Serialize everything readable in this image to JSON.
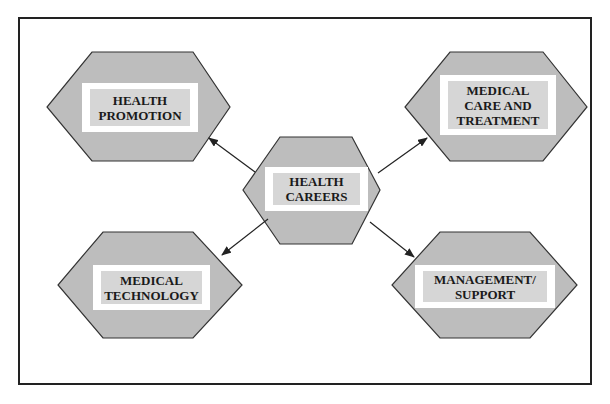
{
  "diagram": {
    "type": "hub-and-spoke",
    "colors": {
      "hexagon_fill": "#bdbdbd",
      "hexagon_stroke": "#333333",
      "label_outer": "#ffffff",
      "label_inner": "#d6d6d6",
      "arrow": "#222222",
      "frame": "#222222"
    },
    "center": {
      "id": "health-careers",
      "label": "HEALTH\nCAREERS"
    },
    "nodes": [
      {
        "id": "health-promotion",
        "label": "HEALTH\nPROMOTION",
        "position": "top-left"
      },
      {
        "id": "medical-care-and-treatment",
        "label": "MEDICAL\nCARE AND\nTREATMENT",
        "position": "top-right"
      },
      {
        "id": "medical-technology",
        "label": "MEDICAL\nTECHNOLOGY",
        "position": "bottom-left"
      },
      {
        "id": "management-support",
        "label": "MANAGEMENT/\nSUPPORT",
        "position": "bottom-right"
      }
    ],
    "edges": [
      {
        "from": "health-careers",
        "to": "health-promotion",
        "directed": true
      },
      {
        "from": "health-careers",
        "to": "medical-care-and-treatment",
        "directed": true
      },
      {
        "from": "health-careers",
        "to": "medical-technology",
        "directed": true
      },
      {
        "from": "health-careers",
        "to": "management-support",
        "directed": true
      }
    ]
  }
}
